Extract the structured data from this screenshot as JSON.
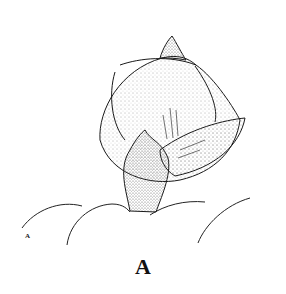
{
  "figure": {
    "caption": "A",
    "corner_label": "A",
    "colors": {
      "ink": "#1a1a1a",
      "background": "#ffffff",
      "stipple": "#555555"
    }
  }
}
